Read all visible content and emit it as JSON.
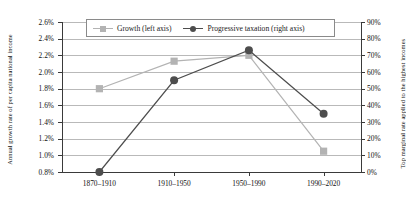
{
  "chart_data": {
    "type": "line",
    "title": "",
    "categories": [
      "1870–1910",
      "1910–1950",
      "1950–1990",
      "1990–2020"
    ],
    "series": [
      {
        "name": "Growth (left axis)",
        "axis": "left",
        "marker": "square",
        "color": "#b3b3b3",
        "values": [
          1.8,
          2.13,
          2.2,
          1.05
        ],
        "unit": "%"
      },
      {
        "name": "Progressive taxation (right axis)",
        "axis": "right",
        "marker": "circle",
        "color": "#4d4d4d",
        "values": [
          0,
          55,
          73,
          35
        ],
        "unit": "%"
      }
    ],
    "xlabel": "",
    "ylabel": "Annual growth rate of per capita national income",
    "y2label": "Top marginal rate applied to the highest incomes",
    "ylim": [
      0.8,
      2.6
    ],
    "y2lim": [
      0,
      90
    ],
    "ytick_labels": [
      "0.8%",
      "1.0%",
      "1.2%",
      "1.4%",
      "1.6%",
      "1.8%",
      "2.0%",
      "2.2%",
      "2.4%",
      "2.6%"
    ],
    "ytick_values": [
      0.8,
      1.0,
      1.2,
      1.4,
      1.6,
      1.8,
      2.0,
      2.2,
      2.4,
      2.6
    ],
    "y2tick_labels": [
      "0%",
      "10%",
      "20%",
      "30%",
      "40%",
      "50%",
      "60%",
      "70%",
      "80%",
      "90%"
    ],
    "y2tick_values": [
      0,
      10,
      20,
      30,
      40,
      50,
      60,
      70,
      80,
      90
    ],
    "grid": true,
    "legend_position": "top-center",
    "grid_color": "#b9b9b9",
    "axis_color": "#3a3a3a"
  },
  "legend": {
    "items": [
      {
        "label": "Growth (left axis)"
      },
      {
        "label": "Progressive taxation (right axis)"
      }
    ]
  },
  "axes": {
    "left_title": "Annual growth rate of per capita national income",
    "right_title": "Top marginal rate applied to the highest incomes"
  }
}
